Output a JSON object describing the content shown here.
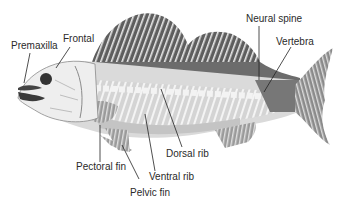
{
  "diagram": {
    "colors": {
      "dorsal_fin": "#5e5e5e",
      "body_dark": "#7a7a7a",
      "body_light": "#d9d9d9",
      "belly": "#c8c8c8",
      "bone": "#f2f2f2",
      "fin_light": "#bdbdbd",
      "leader_line": "#222222",
      "text": "#2a2a2a"
    },
    "labels": [
      {
        "id": "premaxilla",
        "text": "Premaxilla"
      },
      {
        "id": "frontal",
        "text": "Frontal"
      },
      {
        "id": "neural_spine",
        "text": "Neural spine"
      },
      {
        "id": "vertebra",
        "text": "Vertebra"
      },
      {
        "id": "dorsal_rib",
        "text": "Dorsal rib"
      },
      {
        "id": "ventral_rib",
        "text": "Ventral rib"
      },
      {
        "id": "pectoral_fin",
        "text": "Pectoral fin"
      },
      {
        "id": "pelvic_fin",
        "text": "Pelvic fin"
      }
    ]
  }
}
